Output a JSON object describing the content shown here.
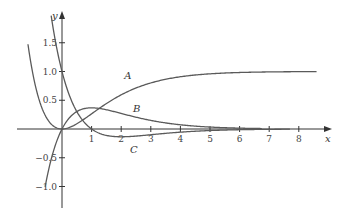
{
  "chart_data": {
    "type": "line",
    "title": "",
    "xlabel": "x",
    "ylabel": "y",
    "xlim": [
      -1.5,
      8.9
    ],
    "ylim": [
      -1.35,
      2.0
    ],
    "grid": false,
    "legend": "none (curves labeled inline)",
    "x_ticks": [
      1,
      2,
      3,
      4,
      5,
      6,
      7,
      8
    ],
    "x_tick_labels": [
      "1",
      "2",
      "3",
      "4",
      "5",
      "6",
      "7",
      "8"
    ],
    "y_ticks": [
      1.5,
      1.0,
      0.5,
      -0.5,
      -1.0
    ],
    "y_tick_labels": [
      "1.5",
      "1.0",
      "0.5",
      "−0.5",
      "−1.0"
    ],
    "series": [
      {
        "name": "A",
        "formula": "1 - (1 + x) e^{-x}",
        "x_range": [
          -1.15,
          8.6
        ],
        "label_at": [
          2.1,
          0.87
        ],
        "x": [
          -1.15,
          -1,
          -0.5,
          0,
          0.5,
          1,
          1.5,
          2,
          3,
          4,
          5,
          6,
          7,
          8,
          8.6
        ],
        "values": [
          1.47,
          1.0,
          0.18,
          0.0,
          0.09,
          0.26,
          0.44,
          0.59,
          0.8,
          0.91,
          0.96,
          0.98,
          0.99,
          1.0,
          1.0
        ]
      },
      {
        "name": "B",
        "formula": "x e^{-x}",
        "x_range": [
          -0.57,
          6.75
        ],
        "label_at": [
          2.4,
          0.3
        ],
        "x": [
          -0.57,
          -0.5,
          0,
          0.5,
          1,
          1.5,
          2,
          3,
          4,
          5,
          6,
          6.75
        ],
        "values": [
          -1.0,
          -0.82,
          0.0,
          0.3,
          0.37,
          0.33,
          0.27,
          0.15,
          0.07,
          0.03,
          0.01,
          0.01
        ]
      },
      {
        "name": "C",
        "formula": "(1 - x) e^{-x}",
        "x_range": [
          -0.4,
          7.7
        ],
        "label_at": [
          2.3,
          -0.42
        ],
        "x": [
          -0.4,
          0,
          0.5,
          1,
          1.5,
          2,
          3,
          4,
          5,
          6,
          7,
          7.7
        ],
        "values": [
          2.09,
          1.0,
          0.3,
          0.0,
          -0.11,
          -0.14,
          -0.1,
          -0.05,
          -0.03,
          -0.01,
          -0.01,
          -0.0
        ]
      }
    ]
  },
  "axes": {
    "x_label": "x",
    "y_label": "y"
  },
  "colors": {
    "axis": "#333333",
    "curve": "#5a5a5a",
    "background": "#ffffff"
  }
}
